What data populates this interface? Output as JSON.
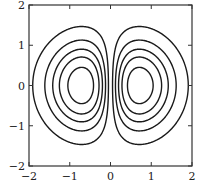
{
  "chart_data": {
    "type": "contour",
    "title": "",
    "xlabel": "",
    "ylabel": "",
    "function_estimate": "z = x * exp(-(x^2 + y^2))",
    "xlim": [
      -2,
      2
    ],
    "ylim": [
      -2,
      2
    ],
    "grid": false,
    "x_ticks": [
      -2,
      -1,
      0,
      1,
      2
    ],
    "x_tick_labels": [
      "−2",
      "−1",
      "0",
      "1",
      "2"
    ],
    "y_ticks": [
      -2,
      -1,
      0,
      1,
      2
    ],
    "y_tick_labels": [
      "−2",
      "−1",
      "0",
      "1",
      "2"
    ],
    "contour_levels": [
      0.05,
      0.12,
      0.19,
      0.26,
      0.35
    ],
    "lobes": [
      {
        "name": "left",
        "center": [
          -0.7,
          0
        ],
        "sign": "negative"
      },
      {
        "name": "right",
        "center": [
          0.7,
          0
        ],
        "sign": "positive"
      }
    ],
    "line_color": "#1a1a1a"
  }
}
